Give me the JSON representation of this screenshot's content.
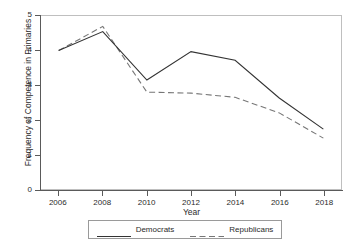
{
  "chart_data": {
    "type": "line",
    "title": "",
    "subtitle": "",
    "xlabel": "Year",
    "ylabel": "Frequency of Competence in Primaries",
    "x": [
      2006,
      2008,
      2010,
      2012,
      2014,
      2016,
      2018
    ],
    "xticklabels": [
      "2006",
      "2008",
      "2010",
      "2012",
      "2014",
      "2016",
      "2018"
    ],
    "yticklabels": [
      "0",
      "1",
      "2",
      "3",
      "4",
      "5"
    ],
    "yticks": [
      0,
      1,
      2,
      3,
      4,
      5
    ],
    "xlim": [
      2005.2,
      2018.8
    ],
    "ylim": [
      0,
      5
    ],
    "grid": false,
    "legend_position": "bottom",
    "series": [
      {
        "name": "Democrats",
        "values": [
          4.0,
          4.55,
          3.15,
          3.97,
          3.72,
          2.63,
          1.73
        ],
        "color": "#333333",
        "style": "solid"
      },
      {
        "name": "Republicans",
        "values": [
          4.0,
          4.7,
          2.8,
          2.77,
          2.65,
          2.2,
          1.47
        ],
        "color": "#767676",
        "style": "dashed"
      }
    ]
  },
  "legend": {
    "items": [
      {
        "label": "Democrats"
      },
      {
        "label": "Republicans"
      }
    ]
  },
  "colors": {
    "democrats": "#333333",
    "republicans": "#767676",
    "axis": "#5a5a5a",
    "frame": "#bfbfbf",
    "background": "#ffffff"
  }
}
